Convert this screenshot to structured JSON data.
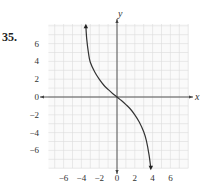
{
  "problem_number": "35.",
  "chart_data": {
    "type": "line",
    "title": "",
    "xlabel": "x",
    "ylabel": "y",
    "xlim": [
      -7.7,
      8
    ],
    "ylim": [
      -8,
      8.2
    ],
    "x_ticks": [
      -6,
      -4,
      -2,
      0,
      2,
      4,
      6
    ],
    "x_tick_labels": [
      "−6",
      "−4",
      "−2",
      "0",
      "2",
      "4",
      "6"
    ],
    "y_ticks": [
      6,
      4,
      2,
      0,
      -2,
      -4,
      -6
    ],
    "y_tick_labels": [
      "6",
      "4",
      "2",
      "0",
      "−2",
      "−4",
      "−6"
    ],
    "grid": true,
    "grid_step": 1,
    "series": [
      {
        "name": "curve",
        "points": [
          [
            -3.5,
            8.0
          ],
          [
            -3.4,
            6.5
          ],
          [
            -3.2,
            4.9
          ],
          [
            -3.0,
            3.9
          ],
          [
            -2.5,
            2.8
          ],
          [
            -2.0,
            2.0
          ],
          [
            -1.5,
            1.35
          ],
          [
            -1.0,
            0.85
          ],
          [
            -0.5,
            0.4
          ],
          [
            0,
            0
          ],
          [
            0.5,
            -0.4
          ],
          [
            1.0,
            -0.85
          ],
          [
            1.5,
            -1.35
          ],
          [
            2.0,
            -2.0
          ],
          [
            2.5,
            -2.8
          ],
          [
            3.0,
            -3.9
          ],
          [
            3.3,
            -4.9
          ],
          [
            3.6,
            -6.5
          ],
          [
            3.8,
            -8.0
          ]
        ],
        "arrow_start": "up",
        "arrow_end": "down"
      }
    ]
  }
}
